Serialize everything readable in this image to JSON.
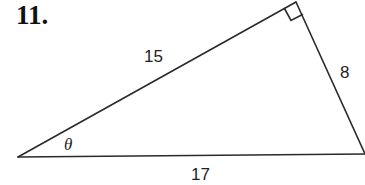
{
  "problem": {
    "number": "11."
  },
  "triangle": {
    "vertices": {
      "left": {
        "x": 18,
        "y": 157
      },
      "top": {
        "x": 296,
        "y": 2
      },
      "right": {
        "x": 365,
        "y": 154
      }
    },
    "right_angle_at": "top",
    "sides": {
      "hypotenuse_label": "17",
      "left_leg_label": "15",
      "right_leg_label": "8"
    },
    "angle_label": "θ",
    "stroke_color": "#2a2a2a"
  }
}
